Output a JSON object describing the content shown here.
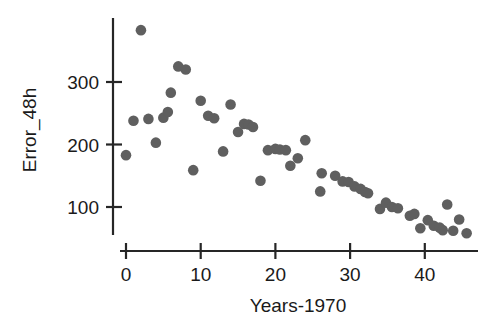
{
  "chart_data": {
    "type": "scatter",
    "title": "",
    "xlabel": "Years-1970",
    "ylabel": "Error_48h",
    "xlim": [
      -1.5,
      48
    ],
    "ylim": [
      20,
      400
    ],
    "xticks": [
      0,
      10,
      20,
      30,
      40
    ],
    "xtick_labels": [
      "0",
      "10",
      "20",
      "30",
      "40"
    ],
    "yticks": [
      100,
      200,
      300
    ],
    "ytick_labels": [
      "100",
      "200",
      "300"
    ],
    "grid": false,
    "legend": false,
    "marker": {
      "shape": "circle",
      "color": "#5f5f5f",
      "size": 6.2
    },
    "series": [
      {
        "name": "Error_48h",
        "points": [
          [
            0,
            183
          ],
          [
            1,
            238
          ],
          [
            2,
            383
          ],
          [
            3,
            241
          ],
          [
            4,
            203
          ],
          [
            5,
            243
          ],
          [
            5.6,
            252
          ],
          [
            6,
            283
          ],
          [
            7,
            325
          ],
          [
            8,
            320
          ],
          [
            9,
            159
          ],
          [
            10,
            270
          ],
          [
            11,
            246
          ],
          [
            11.8,
            242
          ],
          [
            13,
            189
          ],
          [
            14,
            264
          ],
          [
            15,
            220
          ],
          [
            15.8,
            233
          ],
          [
            16.4,
            232
          ],
          [
            17,
            228
          ],
          [
            18,
            142
          ],
          [
            19,
            191
          ],
          [
            20,
            193
          ],
          [
            20.6,
            192
          ],
          [
            21.4,
            191
          ],
          [
            22,
            166
          ],
          [
            23,
            178
          ],
          [
            24,
            207
          ],
          [
            26,
            125
          ],
          [
            26.2,
            154
          ],
          [
            28,
            150
          ],
          [
            29,
            141
          ],
          [
            29.8,
            140
          ],
          [
            30.6,
            133
          ],
          [
            31.4,
            129
          ],
          [
            32,
            124
          ],
          [
            32.4,
            122
          ],
          [
            34,
            97
          ],
          [
            34.8,
            107
          ],
          [
            35.6,
            100
          ],
          [
            36.4,
            98
          ],
          [
            38,
            86
          ],
          [
            38.6,
            89
          ],
          [
            39.4,
            66
          ],
          [
            40.4,
            79
          ],
          [
            41.2,
            70
          ],
          [
            42,
            67
          ],
          [
            42.4,
            63
          ],
          [
            43,
            104
          ],
          [
            43.8,
            62
          ],
          [
            44.6,
            80
          ],
          [
            45.6,
            58
          ]
        ]
      }
    ]
  },
  "axes": {
    "x_axis_name": "x-axis",
    "y_axis_name": "y-axis"
  }
}
